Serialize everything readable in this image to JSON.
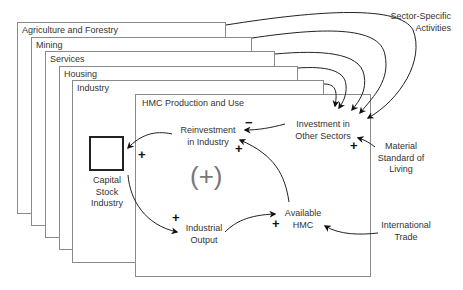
{
  "sectors": [
    {
      "label": "Agriculture and Forestry"
    },
    {
      "label": "Mining"
    },
    {
      "label": "Services"
    },
    {
      "label": "Housing"
    },
    {
      "label": "Industry"
    }
  ],
  "main_panel": {
    "label": "HMC Production and Use"
  },
  "nodes": {
    "sector_specific": {
      "line1": "Sector-Specific",
      "line2": "Activities"
    },
    "investment_other": {
      "line1": "Investment in",
      "line2": "Other Sectors"
    },
    "reinvestment": {
      "line1": "Reinvestment",
      "line2": "in Industry"
    },
    "capital_stock": {
      "line1": "Capital",
      "line2": "Stock",
      "line3": "Industry"
    },
    "industrial_output": {
      "line1": "Industrial",
      "line2": "Output"
    },
    "available_hmc": {
      "line1": "Available",
      "line2": "HMC"
    },
    "material_standard": {
      "line1": "Material",
      "line2": "Standard of",
      "line3": "Living"
    },
    "international_trade": {
      "line1": "International",
      "line2": "Trade"
    }
  },
  "polarities": {
    "invest_to_reinvest": "−",
    "hmc_to_reinvest": "+",
    "reinvest_to_capital": "+",
    "capital_to_output": "+",
    "output_to_hmc": "+",
    "material_to_invest": "+"
  },
  "loop_label": "(+)"
}
